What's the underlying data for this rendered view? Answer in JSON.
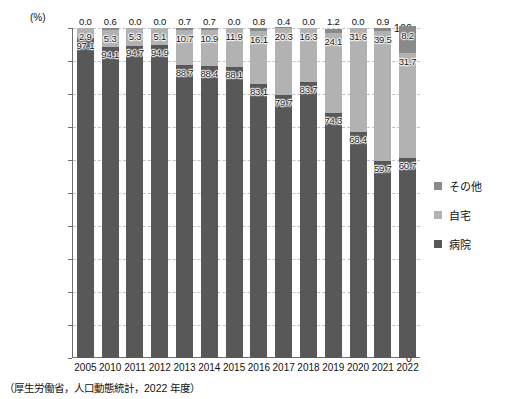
{
  "chart_data": {
    "type": "bar",
    "stacked": true,
    "title": "",
    "xlabel": "",
    "ylabel": "(%)",
    "ylim": [
      0,
      100
    ],
    "ytick_step": 10,
    "yticks": [
      "100",
      "90",
      "80",
      "70",
      "60",
      "50",
      "40",
      "30",
      "20",
      "10",
      "0"
    ],
    "grid": true,
    "legend_position": "right",
    "categories": [
      "2005",
      "2010",
      "2011",
      "2012",
      "2013",
      "2014",
      "2015",
      "2016",
      "2017",
      "2018",
      "2019",
      "2020",
      "2021",
      "2022"
    ],
    "series": [
      {
        "name": "病院",
        "color": "#585858",
        "values": [
          97.1,
          94.1,
          94.7,
          94.9,
          88.7,
          88.4,
          88.1,
          83.1,
          79.7,
          83.7,
          74.3,
          68.4,
          59.7,
          60.7
        ]
      },
      {
        "name": "自宅",
        "color": "#b2b2b2",
        "values": [
          2.9,
          5.3,
          5.3,
          5.1,
          10.7,
          10.9,
          11.9,
          16.1,
          20.3,
          16.3,
          24.1,
          31.6,
          39.5,
          31.7
        ]
      },
      {
        "name": "その他",
        "color": "#8a8a8a",
        "values": [
          0.0,
          0.6,
          0.0,
          0.0,
          0.7,
          0.7,
          0.0,
          0.8,
          0.4,
          0.0,
          1.2,
          0.0,
          0.9,
          8.2
        ]
      }
    ],
    "value_labels": {
      "hospital": [
        "97.1",
        "94.1",
        "94.7",
        "94.9",
        "88.7",
        "88.4",
        "88.1",
        "83.1",
        "79.7",
        "83.7",
        "74.3",
        "68.4",
        "59.7",
        "60.7"
      ],
      "home": [
        "2.9",
        "5.3",
        "5.3",
        "5.1",
        "10.7",
        "10.9",
        "11.9",
        "16.1",
        "20.3",
        "16.3",
        "24.1",
        "31.6",
        "39.5",
        "31.7"
      ],
      "other": [
        "0.0",
        "0.6",
        "0.0",
        "0.0",
        "0.7",
        "0.7",
        "0.0",
        "0.8",
        "0.4",
        "0.0",
        "1.2",
        "0.0",
        "0.9",
        "8.2"
      ]
    },
    "source_note": "（厚生労働省，人口動態統計，2022 年度）"
  },
  "legend": {
    "items": [
      {
        "label": "その他",
        "key": "other"
      },
      {
        "label": "自宅",
        "key": "home"
      },
      {
        "label": "病院",
        "key": "hospital"
      }
    ]
  },
  "axis": {
    "unit": "(%)"
  }
}
